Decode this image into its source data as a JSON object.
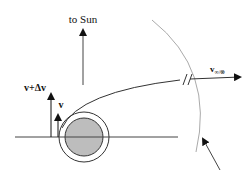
{
  "diagram": {
    "labels": {
      "to_sun": "to Sun",
      "v": "v",
      "v_plus_dv": "v+Δv",
      "v_inf_main": "v",
      "v_inf_sub": "∞/⊗"
    },
    "colors": {
      "line": "#333333",
      "planet_fill": "#bdbdbd",
      "soi_arc": "#aaaaaa",
      "background": "#ffffff"
    }
  }
}
